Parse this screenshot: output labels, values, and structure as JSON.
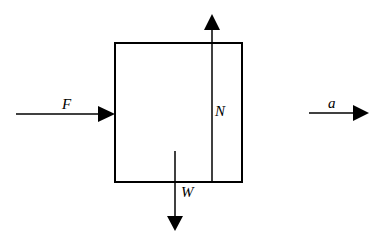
{
  "diagram": {
    "type": "free-body-diagram",
    "colors": {
      "stroke": "#000000",
      "background": "#ffffff"
    },
    "block": {
      "x": 115,
      "y": 43,
      "width": 127,
      "height": 139
    },
    "forces": [
      {
        "id": "F",
        "label": "F",
        "direction": "right",
        "description": "applied force pushing on left side of block"
      },
      {
        "id": "N",
        "label": "N",
        "direction": "up",
        "description": "normal force"
      },
      {
        "id": "W",
        "label": "W",
        "direction": "down",
        "description": "weight"
      }
    ],
    "acceleration": {
      "id": "a",
      "label": "a",
      "direction": "right"
    }
  }
}
